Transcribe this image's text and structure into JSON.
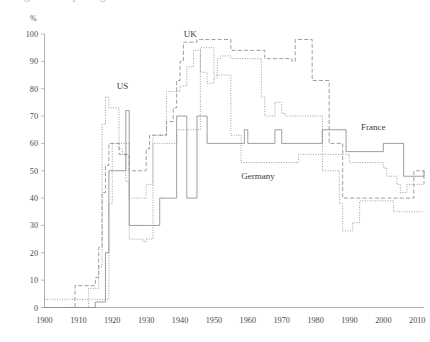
{
  "figure": {
    "cut_title": "Figure 1. Top marginal income tax rates",
    "unit_label": "%"
  },
  "chart_data": {
    "type": "line",
    "title": "",
    "subtitle": "",
    "xlabel": "",
    "ylabel": "%",
    "xlim": [
      1900,
      2012
    ],
    "ylim": [
      0,
      100
    ],
    "grid": false,
    "legend_position": "inline-annotations",
    "xticks": [
      1900,
      1910,
      1920,
      1930,
      1940,
      1950,
      1960,
      1970,
      1980,
      1990,
      2000,
      2010
    ],
    "yticks": [
      0,
      10,
      20,
      30,
      40,
      50,
      60,
      70,
      80,
      90,
      100
    ],
    "annotations": [
      {
        "text": "US",
        "x": 1923,
        "y": 80
      },
      {
        "text": "UK",
        "x": 1943,
        "y": 99
      },
      {
        "text": "Germany",
        "x": 1963,
        "y": 47
      },
      {
        "text": "France",
        "x": 1997,
        "y": 65
      }
    ],
    "series": [
      {
        "name": "US",
        "style": "dashed",
        "x": [
          1900,
          1909,
          1910,
          1912,
          1913,
          1914,
          1915,
          1916,
          1917,
          1918,
          1919,
          1921,
          1922,
          1923,
          1924,
          1925,
          1926,
          1929,
          1930,
          1931,
          1932,
          1933,
          1934,
          1935,
          1936,
          1939,
          1940,
          1941,
          1942,
          1943,
          1944,
          1945,
          1946,
          1948,
          1950,
          1951,
          1952,
          1954,
          1955,
          1963,
          1964,
          1965,
          1968,
          1970,
          1971,
          1972,
          1981,
          1982,
          1983,
          1986,
          1987,
          1988,
          1991,
          1993,
          2001,
          2003,
          2012
        ],
        "values": [
          0,
          0,
          0,
          0,
          7,
          7,
          7,
          15,
          67,
          77,
          73,
          73,
          58,
          56,
          46,
          25,
          25,
          24,
          25,
          25,
          63,
          63,
          63,
          63,
          79,
          79,
          81,
          81,
          88,
          88,
          94,
          94,
          86,
          82,
          84,
          91,
          92,
          92,
          91,
          91,
          77,
          70,
          75,
          71,
          70,
          70,
          70,
          50,
          50,
          50,
          38,
          28,
          31,
          39,
          39,
          35,
          35
        ]
      },
      {
        "name": "UK",
        "style": "dashed",
        "x": [
          1900,
          1907,
          1909,
          1910,
          1913,
          1914,
          1915,
          1916,
          1917,
          1918,
          1919,
          1922,
          1925,
          1930,
          1931,
          1934,
          1936,
          1938,
          1939,
          1940,
          1941,
          1942,
          1945,
          1946,
          1951,
          1952,
          1955,
          1959,
          1965,
          1966,
          1971,
          1973,
          1974,
          1978,
          1979,
          1984,
          1988,
          1990,
          2009,
          2012
        ],
        "values": [
          0,
          0,
          8,
          8,
          8,
          8,
          11,
          22,
          42,
          52,
          60,
          56,
          50,
          58,
          63,
          63,
          68,
          73,
          83,
          90,
          97,
          97,
          98,
          98,
          98,
          98,
          94,
          94,
          91,
          91,
          91,
          90,
          98,
          98,
          83,
          60,
          40,
          40,
          50,
          45
        ]
      },
      {
        "name": "Germany",
        "style": "dotted",
        "x": [
          1900,
          1913,
          1918,
          1919,
          1920,
          1921,
          1925,
          1930,
          1932,
          1934,
          1939,
          1941,
          1946,
          1948,
          1950,
          1955,
          1958,
          1965,
          1975,
          1979,
          1990,
          1991,
          2000,
          2001,
          2004,
          2005,
          2007,
          2012
        ],
        "values": [
          3,
          3,
          3,
          38,
          60,
          60,
          40,
          45,
          60,
          60,
          65,
          65,
          95,
          95,
          85,
          63,
          53,
          53,
          56,
          56,
          53,
          53,
          51,
          48,
          45,
          42,
          45,
          45
        ]
      },
      {
        "name": "France",
        "style": "solid",
        "x": [
          1900,
          1914,
          1915,
          1917,
          1918,
          1919,
          1920,
          1924,
          1925,
          1926,
          1930,
          1934,
          1936,
          1938,
          1939,
          1941,
          1942,
          1944,
          1945,
          1948,
          1950,
          1952,
          1955,
          1959,
          1960,
          1963,
          1968,
          1970,
          1975,
          1980,
          1982,
          1986,
          1989,
          1994,
          1996,
          2000,
          2006,
          2007,
          2012
        ],
        "values": [
          0,
          0,
          2,
          2,
          20,
          50,
          50,
          72,
          30,
          30,
          30,
          40,
          40,
          40,
          70,
          70,
          40,
          40,
          70,
          60,
          60,
          60,
          60,
          65,
          60,
          60,
          65,
          60,
          60,
          60,
          65,
          65,
          57,
          57,
          57,
          60,
          48,
          48,
          50
        ]
      }
    ]
  }
}
